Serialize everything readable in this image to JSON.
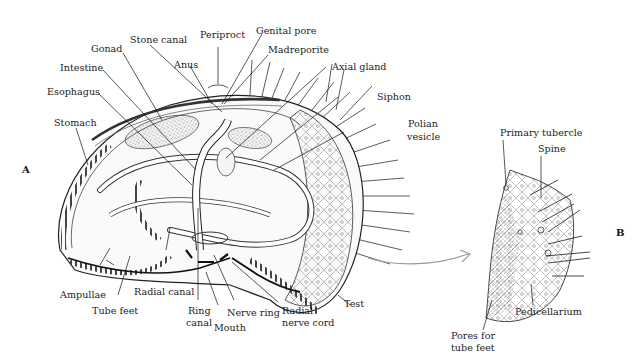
{
  "figure": {
    "panels": [
      {
        "id": "A",
        "label": "A"
      },
      {
        "id": "B",
        "label": "B"
      }
    ],
    "panel_a_labels": {
      "periproct": "Periproct",
      "genital_pore": "Genital pore",
      "stone_canal": "Stone canal",
      "madreporite": "Madreporite",
      "gonad": "Gonad",
      "anus": "Anus",
      "axial_gland": "Axial gland",
      "intestine": "Intestine",
      "esophagus": "Esophagus",
      "siphon": "Siphon",
      "stomach": "Stomach",
      "polian_vesicle_1": "Polian",
      "polian_vesicle_2": "vesicle",
      "ampullae": "Ampullae",
      "radial_canal": "Radial canal",
      "tube_feet": "Tube feet",
      "ring_canal_1": "Ring",
      "ring_canal_2": "canal",
      "mouth": "Mouth",
      "nerve_ring": "Nerve ring",
      "radial_nerve_cord_1": "Radial",
      "radial_nerve_cord_2": "nerve cord",
      "test": "Test"
    },
    "panel_b_labels": {
      "primary_tubercle": "Primary tubercle",
      "spine": "Spine",
      "pedicellarium": "Pedicellarium",
      "pores_1": "Pores for",
      "pores_2": "tube feet"
    },
    "caption_partial": "l     id     Fi   l   l        i l   l    l         l"
  }
}
